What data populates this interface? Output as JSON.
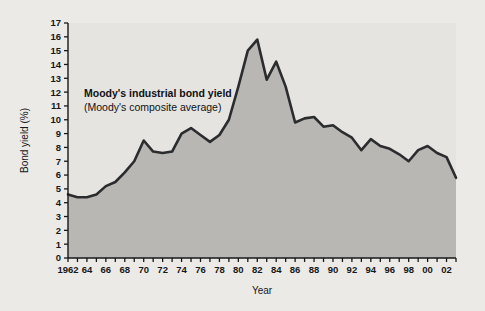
{
  "figure": {
    "background_color": "#eceae6",
    "plot_background_color": "#e6e4e0",
    "area_fill_color": "#b9b7b4",
    "line_color": "#2b2c2e",
    "axis_color": "#17181a"
  },
  "annotation": {
    "line1": "Moody's industrial bond yield",
    "line2": "(Moody's composite average)"
  },
  "chart_data": {
    "type": "area",
    "title": "",
    "xlabel": "Year",
    "ylabel": "Bond yield (%)",
    "xlim": [
      1962,
      2003
    ],
    "ylim": [
      0,
      17
    ],
    "grid": false,
    "legend": null,
    "y_ticks": [
      0,
      1,
      2,
      3,
      4,
      5,
      6,
      7,
      8,
      9,
      10,
      11,
      12,
      13,
      14,
      15,
      16,
      17
    ],
    "y_tick_labels": [
      "0",
      "1",
      "2",
      "3",
      "4",
      "5",
      "6",
      "7",
      "8",
      "9",
      "10",
      "11",
      "12",
      "13",
      "14",
      "15",
      "16",
      "17"
    ],
    "x_ticks": [
      1962,
      1963,
      1964,
      1965,
      1966,
      1967,
      1968,
      1969,
      1970,
      1971,
      1972,
      1973,
      1974,
      1975,
      1976,
      1977,
      1978,
      1979,
      1980,
      1981,
      1982,
      1983,
      1984,
      1985,
      1986,
      1987,
      1988,
      1989,
      1990,
      1991,
      1992,
      1993,
      1994,
      1995,
      1996,
      1997,
      1998,
      1999,
      2000,
      2001,
      2002,
      2003
    ],
    "x_tick_labels": [
      "1962",
      "",
      "64",
      "",
      "66",
      "",
      "68",
      "",
      "70",
      "",
      "72",
      "",
      "74",
      "",
      "76",
      "",
      "78",
      "",
      "80",
      "",
      "82",
      "",
      "84",
      "",
      "86",
      "",
      "88",
      "",
      "90",
      "",
      "92",
      "",
      "94",
      "",
      "96",
      "",
      "98",
      "",
      "00",
      "",
      "02",
      ""
    ],
    "series": [
      {
        "name": "Moody's industrial bond yield",
        "x": [
          1962,
          1963,
          1964,
          1965,
          1966,
          1967,
          1968,
          1969,
          1970,
          1971,
          1972,
          1973,
          1974,
          1975,
          1976,
          1977,
          1978,
          1979,
          1980,
          1981,
          1982,
          1983,
          1984,
          1985,
          1986,
          1987,
          1988,
          1989,
          1990,
          1991,
          1992,
          1993,
          1994,
          1995,
          1996,
          1997,
          1998,
          1999,
          2000,
          2001,
          2002,
          2003
        ],
        "values": [
          4.6,
          4.4,
          4.4,
          4.6,
          5.2,
          5.5,
          6.2,
          7.0,
          8.5,
          7.7,
          7.6,
          7.7,
          9.0,
          9.4,
          8.9,
          8.4,
          8.9,
          10.0,
          12.4,
          15.0,
          15.8,
          12.9,
          14.2,
          12.4,
          9.8,
          10.1,
          10.2,
          9.5,
          9.6,
          9.1,
          8.7,
          7.8,
          8.6,
          8.1,
          7.9,
          7.5,
          7.0,
          7.8,
          8.1,
          7.6,
          7.3,
          5.8
        ]
      }
    ]
  }
}
